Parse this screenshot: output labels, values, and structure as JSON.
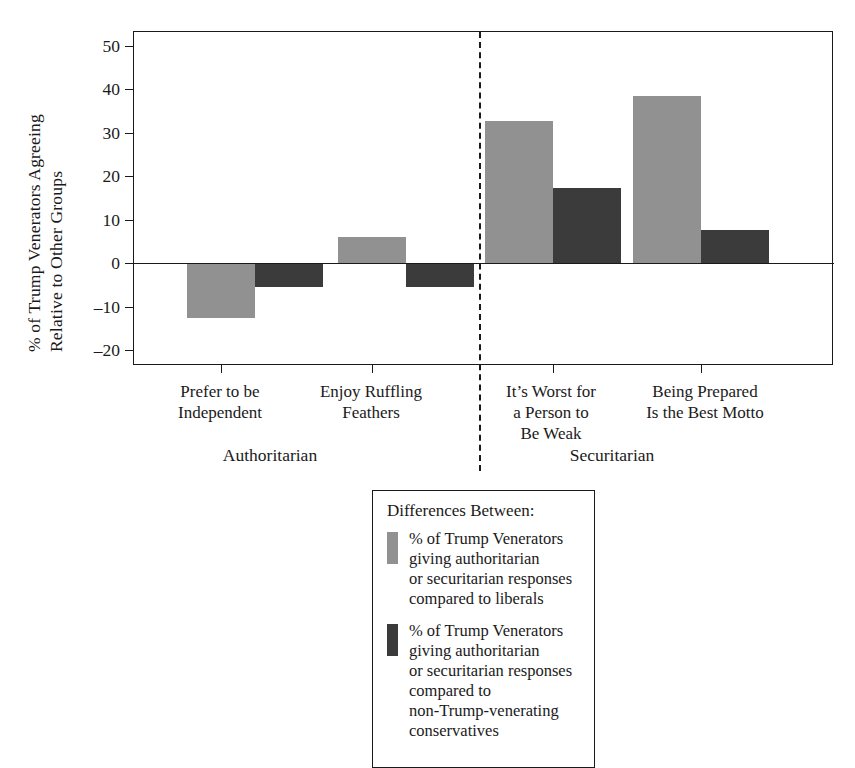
{
  "chart_data": {
    "type": "bar",
    "title": "",
    "xlabel": "",
    "ylabel_line1": "% of Trump Venerators Agreeing",
    "ylabel_line2": "Relative to Other Groups",
    "ylim": [
      -20,
      50
    ],
    "yticks": [
      50,
      40,
      30,
      20,
      10,
      0,
      -10,
      -20
    ],
    "ytick_labels": [
      "50",
      "40",
      "30",
      "20",
      "10",
      "0",
      "–10",
      "–20"
    ],
    "grid": false,
    "legend_position": "below-center",
    "categories": [
      "Prefer to be\nIndependent",
      "Enjoy Ruffling\nFeathers",
      "It’s Worst for\na Person to\nBe Weak",
      "Being Prepared\nIs the Best Motto"
    ],
    "category_groups": [
      {
        "label": "Authoritarian",
        "categories": [
          0,
          1
        ]
      },
      {
        "label": "Securitarian",
        "categories": [
          2,
          3
        ]
      }
    ],
    "series": [
      {
        "name": "% of Trump Venerators giving authoritarian\nor securitarian responses compared to liberals",
        "color": "#919191",
        "values": [
          -12.5,
          6,
          32.5,
          38
        ]
      },
      {
        "name": "% of Trump Venerators giving authoritarian\nor securitarian responses compared to\nnon-Trump-venerating conservatives",
        "color": "#3b3b3b",
        "values": [
          -5.5,
          -5.5,
          17,
          7.5
        ]
      }
    ],
    "annotations": {
      "divider": "dashed vertical line separating Authoritarian from Securitarian items"
    }
  },
  "legend": {
    "title": "Differences Between:",
    "entries": [
      {
        "swatch": "light",
        "text": "% of Trump Venerators giving authoritarian\nor securitarian responses compared to liberals"
      },
      {
        "swatch": "dark",
        "text": "% of Trump Venerators giving authoritarian\nor securitarian responses compared to\nnon-Trump-venerating conservatives"
      }
    ]
  },
  "axis": {
    "ytick_labels": [
      "50",
      "40",
      "30",
      "20",
      "10",
      "0",
      "–10",
      "–20"
    ],
    "ylabel_line1": "% of Trump Venerators Agreeing",
    "ylabel_line2": "Relative to Other Groups"
  },
  "xaxis": {
    "cat0": "Prefer to be\nIndependent",
    "cat1": "Enjoy Ruffling\nFeathers",
    "cat2": "It’s Worst for\na Person to\nBe Weak",
    "cat3": "Being Prepared\nIs the Best Motto",
    "group0": "Authoritarian",
    "group1": "Securitarian"
  },
  "colors": {
    "light_bar": "#919191",
    "dark_bar": "#3b3b3b",
    "axis": "#1a1a1a",
    "background": "#ffffff"
  }
}
